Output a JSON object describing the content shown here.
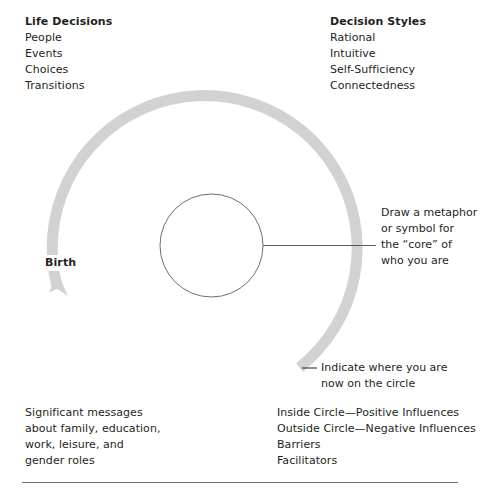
{
  "diagram": {
    "colors": {
      "ring": "#d2d2d2",
      "inner_circle_stroke": "#58595b",
      "text": "#231f20",
      "rule": "#6d6e71",
      "background": "#ffffff"
    },
    "top_left": {
      "heading": "Life Decisions",
      "items": [
        "People",
        "Events",
        "Choices",
        "Transitions"
      ]
    },
    "top_right": {
      "heading": "Decision Styles",
      "items": [
        "Rational",
        "Intuitive",
        "Self-Sufficiency",
        "Connectedness"
      ]
    },
    "bottom_left": {
      "lines": [
        "Significant messages",
        "about family, education,",
        "work, leisure, and",
        "gender roles"
      ]
    },
    "bottom_right": {
      "lines": [
        "Inside Circle—Positive Influences",
        "Outside Circle—Negative Influences",
        "Barriers",
        "Facilitators"
      ]
    },
    "callout_core": {
      "lines": [
        "Draw a metaphor",
        "or symbol for",
        "the “core” of",
        "who you are"
      ]
    },
    "callout_position": {
      "lines": [
        "Indicate where you are",
        "now on the circle"
      ]
    },
    "ring_label": "Birth",
    "icons": {
      "arrow": "arrow-up-icon",
      "leader_line": "leader-line-icon",
      "dash": "em-dash-icon"
    }
  }
}
